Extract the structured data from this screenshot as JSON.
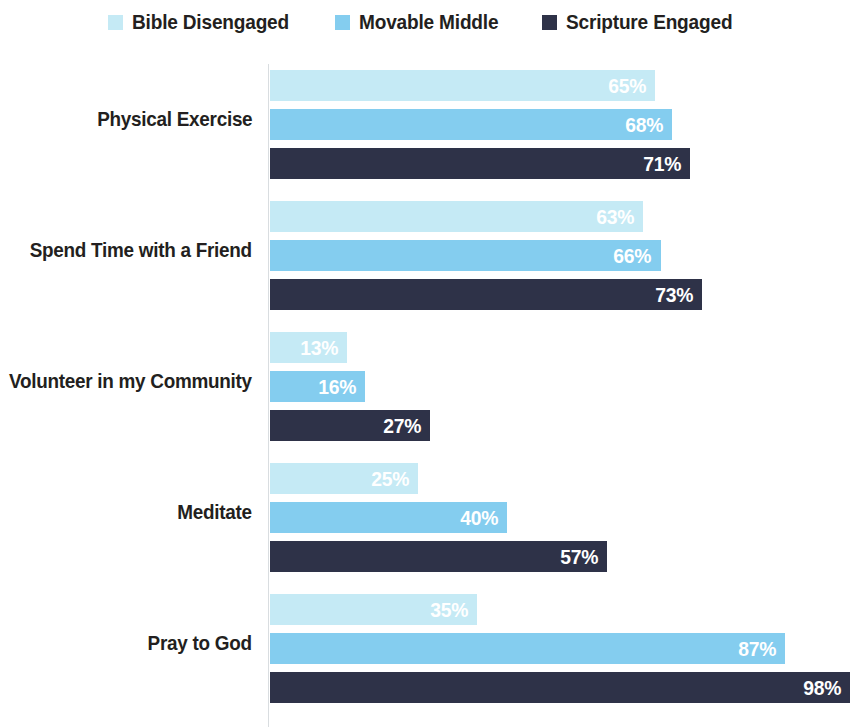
{
  "legend": {
    "items": [
      {
        "label": "Bible Disengaged",
        "color": "#C5EAF5",
        "icon": "square-swatch-icon"
      },
      {
        "label": "Movable Middle",
        "color": "#84CDEF",
        "icon": "square-swatch-icon"
      },
      {
        "label": "Scripture Engaged",
        "color": "#2E3248",
        "icon": "square-swatch-icon"
      }
    ]
  },
  "chart_data": {
    "type": "bar",
    "orientation": "horizontal",
    "title": "",
    "xlabel": "",
    "ylabel": "",
    "xlim": [
      0,
      98
    ],
    "grid": false,
    "legend_position": "top-center",
    "value_suffix": "%",
    "categories": [
      "Physical Exercise",
      "Spend Time with a Friend",
      "Volunteer in my Community",
      "Meditate",
      "Pray to God"
    ],
    "series": [
      {
        "name": "Bible Disengaged",
        "color": "#C5EAF5",
        "values": [
          65,
          68,
          13,
          25,
          35
        ]
      },
      {
        "name": "Movable Middle",
        "color": "#84CDEF",
        "values": [
          68,
          66,
          16,
          40,
          87
        ]
      },
      {
        "name": "Scripture Engaged",
        "color": "#2E3248",
        "values": [
          71,
          73,
          27,
          57,
          98
        ]
      }
    ],
    "value_labels": [
      [
        "65%",
        "68%",
        "71%"
      ],
      [
        "63%",
        "66%",
        "73%"
      ],
      [
        "13%",
        "16%",
        "27%"
      ],
      [
        "25%",
        "40%",
        "57%"
      ],
      [
        "35%",
        "87%",
        "98%"
      ]
    ],
    "groups": [
      {
        "category": "Physical Exercise",
        "bars": [
          {
            "series": "Bible Disengaged",
            "value": 65,
            "label": "65%"
          },
          {
            "series": "Movable Middle",
            "value": 68,
            "label": "68%"
          },
          {
            "series": "Scripture Engaged",
            "value": 71,
            "label": "71%"
          }
        ]
      },
      {
        "category": "Spend Time with a Friend",
        "bars": [
          {
            "series": "Bible Disengaged",
            "value": 63,
            "label": "63%"
          },
          {
            "series": "Movable Middle",
            "value": 66,
            "label": "66%"
          },
          {
            "series": "Scripture Engaged",
            "value": 73,
            "label": "73%"
          }
        ]
      },
      {
        "category": "Volunteer in my Community",
        "bars": [
          {
            "series": "Bible Disengaged",
            "value": 13,
            "label": "13%"
          },
          {
            "series": "Movable Middle",
            "value": 16,
            "label": "16%"
          },
          {
            "series": "Scripture Engaged",
            "value": 27,
            "label": "27%"
          }
        ]
      },
      {
        "category": "Meditate",
        "bars": [
          {
            "series": "Bible Disengaged",
            "value": 25,
            "label": "25%"
          },
          {
            "series": "Movable Middle",
            "value": 40,
            "label": "40%"
          },
          {
            "series": "Scripture Engaged",
            "value": 57,
            "label": "57%"
          }
        ]
      },
      {
        "category": "Pray to God",
        "bars": [
          {
            "series": "Bible Disengaged",
            "value": 35,
            "label": "35%"
          },
          {
            "series": "Movable Middle",
            "value": 87,
            "label": "87%"
          },
          {
            "series": "Scripture Engaged",
            "value": 98,
            "label": "98%"
          }
        ]
      }
    ]
  },
  "axis": {
    "color": "#d9dde0"
  }
}
